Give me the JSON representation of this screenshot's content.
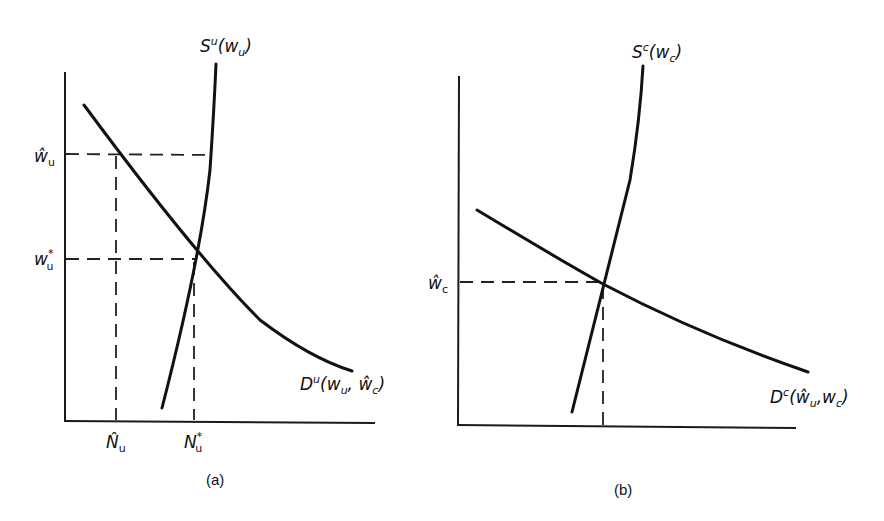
{
  "figure": {
    "panel_a": {
      "caption": "(a)",
      "supply_label": {
        "main": "S",
        "sup": "u",
        "args": "(w",
        "argsub": "u",
        "close": ")"
      },
      "demand_label": {
        "main": "D",
        "sup": "u",
        "args": "(w",
        "argsub": "u",
        "mid": ", ŵ",
        "midsub": "c",
        "close": ")"
      },
      "y_ticks": [
        {
          "main": "ŵ",
          "sub": "u",
          "meaning": "w-hat u"
        },
        {
          "main": "w",
          "sup": "*",
          "sub": "u",
          "meaning": "w star u"
        }
      ],
      "x_ticks": [
        {
          "main": "N̂",
          "sub": "u",
          "meaning": "N-hat u"
        },
        {
          "main": "N",
          "sup": "*",
          "sub": "u",
          "meaning": "N star u"
        }
      ]
    },
    "panel_b": {
      "caption": "(b)",
      "supply_label": {
        "main": "S",
        "sup": "c",
        "args": "(w",
        "argsub": "c",
        "close": ")"
      },
      "demand_label": {
        "main": "D",
        "sup": "c",
        "args": "(ŵ",
        "argsub": "u",
        "mid": ",w",
        "midsub": "c",
        "close": ")"
      },
      "y_ticks": [
        {
          "main": "ŵ",
          "sub": "c",
          "meaning": "w-hat c"
        }
      ]
    }
  },
  "colors": {
    "ink": "#111111",
    "background": "#ffffff"
  }
}
